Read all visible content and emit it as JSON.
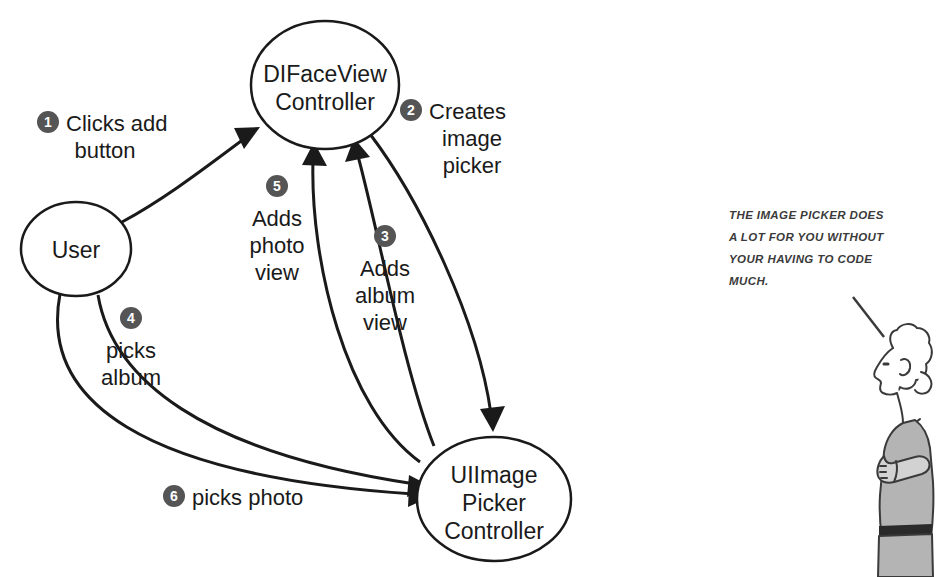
{
  "diagram": {
    "background_color": "#ffffff",
    "stroke_color": "#1a1a1a",
    "badge_color": "#555555",
    "badge_text_color": "#ffffff",
    "nodes": [
      {
        "id": "user",
        "lines": [
          "User"
        ],
        "cx": 76,
        "cy": 249,
        "rx": 55,
        "ry": 47
      },
      {
        "id": "difaceviewcontroller",
        "lines": [
          "DIFaceView",
          "Controller"
        ],
        "cx": 325,
        "cy": 85,
        "rx": 74,
        "ry": 64
      },
      {
        "id": "uiimagepickercontroller",
        "lines": [
          "UIImage",
          "Picker",
          "Controller"
        ],
        "cx": 494,
        "cy": 499,
        "rx": 77,
        "ry": 62
      }
    ],
    "steps": [
      {
        "number": "1",
        "lines": [
          "Clicks add",
          "button"
        ],
        "badge_x": 48,
        "badge_y": 122,
        "text_x": 66,
        "text_y": 131,
        "align": "start",
        "from": "user",
        "to": "difaceviewcontroller"
      },
      {
        "number": "2",
        "lines": [
          "Creates",
          "image",
          "picker"
        ],
        "badge_x": 411,
        "badge_y": 110,
        "text_x": 429,
        "text_y": 119,
        "align": "start",
        "from": "difaceviewcontroller",
        "to": "uiimagepickercontroller"
      },
      {
        "number": "3",
        "lines": [
          "Adds",
          "album",
          "view"
        ],
        "badge_x": 385,
        "badge_y": 236,
        "text_x": 385,
        "text_y": 276,
        "align": "middle",
        "from": "uiimagepickercontroller",
        "to": "difaceviewcontroller"
      },
      {
        "number": "4",
        "lines": [
          "picks",
          "album"
        ],
        "badge_x": 131,
        "badge_y": 318,
        "text_x": 131,
        "text_y": 358,
        "align": "middle",
        "from": "user",
        "to": "uiimagepickercontroller"
      },
      {
        "number": "5",
        "lines": [
          "Adds",
          "photo",
          "view"
        ],
        "badge_x": 277,
        "badge_y": 186,
        "text_x": 277,
        "text_y": 226,
        "align": "middle",
        "from": "uiimagepickercontroller",
        "to": "difaceviewcontroller"
      },
      {
        "number": "6",
        "lines": [
          "picks photo"
        ],
        "badge_x": 174,
        "badge_y": 496,
        "text_x": 192,
        "text_y": 505,
        "align": "start",
        "from": "user",
        "to": "uiimagepickercontroller"
      }
    ]
  },
  "annotation": {
    "caption_lines": [
      "THE IMAGE PICKER DOES",
      "A LOT FOR YOU WITHOUT",
      "YOUR HAVING TO CODE",
      "MUCH."
    ],
    "caption_x": 729,
    "caption_y": 219,
    "line_height": 22,
    "figure_name": "standing-person-arms-crossed",
    "figure_fill": "#b4b4b4",
    "figure_stroke": "#3a3a3a"
  }
}
